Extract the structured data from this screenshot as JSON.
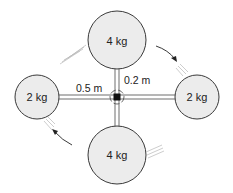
{
  "diagram": {
    "title": "",
    "masses": [
      {
        "id": "top",
        "label": "4 kg",
        "cx": 117,
        "cy": 40,
        "r": 29
      },
      {
        "id": "bottom",
        "label": "4 kg",
        "cx": 117,
        "cy": 155,
        "r": 29
      },
      {
        "id": "left",
        "label": "2 kg",
        "cx": 37,
        "cy": 97,
        "r": 22
      },
      {
        "id": "right",
        "label": "2 kg",
        "cx": 197,
        "cy": 97,
        "r": 22
      }
    ],
    "dimensions": {
      "horizontal_arm": "0.5 m",
      "vertical_arm": "0.2 m"
    },
    "rotation": "clockwise",
    "colors": {
      "mass_fill": "#ececec",
      "outline": "#3a3a3a",
      "hub": "#111111"
    }
  }
}
